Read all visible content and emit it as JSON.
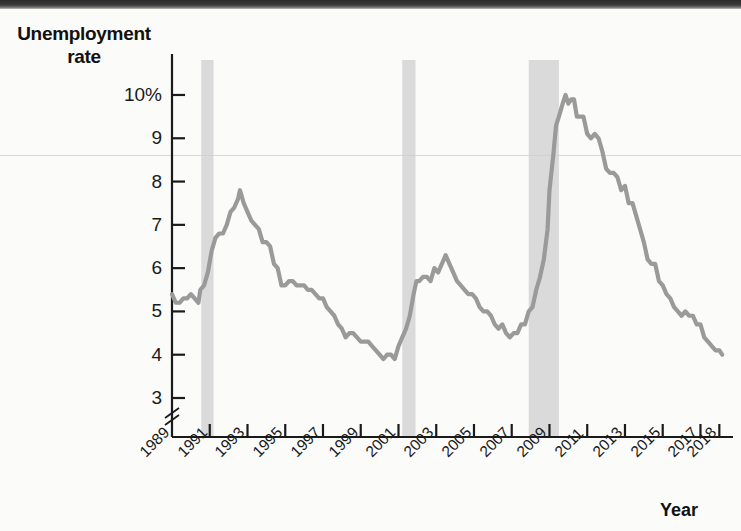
{
  "chart_data": {
    "type": "line",
    "title": "",
    "ylabel": "Unemployment rate",
    "xlabel": "Year",
    "y_unit": "%",
    "ylim": [
      3,
      10.6
    ],
    "xlim": [
      1989,
      2018.3
    ],
    "grid": false,
    "legend": "none",
    "axis_break_y": true,
    "y_ticks": [
      {
        "value": 10,
        "label": "10%"
      },
      {
        "value": 9,
        "label": "9"
      },
      {
        "value": 8,
        "label": "8"
      },
      {
        "value": 7,
        "label": "7"
      },
      {
        "value": 6,
        "label": "6"
      },
      {
        "value": 5,
        "label": "5"
      },
      {
        "value": 4,
        "label": "4"
      },
      {
        "value": 3,
        "label": "3"
      }
    ],
    "x_ticks": [
      {
        "value": 1989,
        "label": "1989"
      },
      {
        "value": 1991,
        "label": "1991"
      },
      {
        "value": 1993,
        "label": "1993"
      },
      {
        "value": 1995,
        "label": "1995"
      },
      {
        "value": 1997,
        "label": "1997"
      },
      {
        "value": 1999,
        "label": "1999"
      },
      {
        "value": 2001,
        "label": "2001"
      },
      {
        "value": 2003,
        "label": "2003"
      },
      {
        "value": 2005,
        "label": "2005"
      },
      {
        "value": 2007,
        "label": "2007"
      },
      {
        "value": 2009,
        "label": "2009"
      },
      {
        "value": 2011,
        "label": "2011"
      },
      {
        "value": 2013,
        "label": "2013"
      },
      {
        "value": 2015,
        "label": "2015"
      },
      {
        "value": 2017,
        "label": "2017"
      },
      {
        "value": 2018,
        "label": "2018"
      }
    ],
    "recession_bands": [
      {
        "name": "recession-1990-1991",
        "start": 1990.55,
        "end": 1991.2
      },
      {
        "name": "recession-2001",
        "start": 2001.2,
        "end": 2001.9
      },
      {
        "name": "recession-2007-2009",
        "start": 2007.9,
        "end": 2009.5
      }
    ],
    "series": [
      {
        "name": "Unemployment rate",
        "color": "#9a9a9a",
        "points": [
          [
            1989.0,
            5.4
          ],
          [
            1989.2,
            5.2
          ],
          [
            1989.4,
            5.2
          ],
          [
            1989.6,
            5.3
          ],
          [
            1989.8,
            5.3
          ],
          [
            1990.0,
            5.4
          ],
          [
            1990.2,
            5.3
          ],
          [
            1990.4,
            5.2
          ],
          [
            1990.5,
            5.5
          ],
          [
            1990.7,
            5.6
          ],
          [
            1990.9,
            5.9
          ],
          [
            1991.1,
            6.4
          ],
          [
            1991.3,
            6.7
          ],
          [
            1991.5,
            6.8
          ],
          [
            1991.7,
            6.8
          ],
          [
            1991.9,
            7.0
          ],
          [
            1992.1,
            7.3
          ],
          [
            1992.3,
            7.4
          ],
          [
            1992.5,
            7.6
          ],
          [
            1992.6,
            7.8
          ],
          [
            1992.8,
            7.5
          ],
          [
            1993.0,
            7.3
          ],
          [
            1993.2,
            7.1
          ],
          [
            1993.4,
            7.0
          ],
          [
            1993.6,
            6.9
          ],
          [
            1993.8,
            6.6
          ],
          [
            1994.0,
            6.6
          ],
          [
            1994.2,
            6.5
          ],
          [
            1994.4,
            6.1
          ],
          [
            1994.6,
            6.0
          ],
          [
            1994.8,
            5.6
          ],
          [
            1995.0,
            5.6
          ],
          [
            1995.2,
            5.7
          ],
          [
            1995.4,
            5.7
          ],
          [
            1995.6,
            5.6
          ],
          [
            1995.8,
            5.6
          ],
          [
            1996.0,
            5.6
          ],
          [
            1996.2,
            5.5
          ],
          [
            1996.4,
            5.5
          ],
          [
            1996.6,
            5.4
          ],
          [
            1996.8,
            5.3
          ],
          [
            1997.0,
            5.3
          ],
          [
            1997.2,
            5.1
          ],
          [
            1997.4,
            5.0
          ],
          [
            1997.6,
            4.9
          ],
          [
            1997.8,
            4.7
          ],
          [
            1998.0,
            4.6
          ],
          [
            1998.2,
            4.4
          ],
          [
            1998.4,
            4.5
          ],
          [
            1998.6,
            4.5
          ],
          [
            1998.8,
            4.4
          ],
          [
            1999.0,
            4.3
          ],
          [
            1999.2,
            4.3
          ],
          [
            1999.4,
            4.3
          ],
          [
            1999.6,
            4.2
          ],
          [
            1999.8,
            4.1
          ],
          [
            2000.0,
            4.0
          ],
          [
            2000.2,
            3.9
          ],
          [
            2000.4,
            4.0
          ],
          [
            2000.6,
            4.0
          ],
          [
            2000.8,
            3.9
          ],
          [
            2001.0,
            4.2
          ],
          [
            2001.2,
            4.4
          ],
          [
            2001.4,
            4.6
          ],
          [
            2001.6,
            4.9
          ],
          [
            2001.8,
            5.4
          ],
          [
            2001.95,
            5.7
          ],
          [
            2002.1,
            5.7
          ],
          [
            2002.3,
            5.8
          ],
          [
            2002.5,
            5.8
          ],
          [
            2002.7,
            5.7
          ],
          [
            2002.9,
            6.0
          ],
          [
            2003.1,
            5.9
          ],
          [
            2003.3,
            6.1
          ],
          [
            2003.5,
            6.3
          ],
          [
            2003.7,
            6.1
          ],
          [
            2003.9,
            5.9
          ],
          [
            2004.1,
            5.7
          ],
          [
            2004.3,
            5.6
          ],
          [
            2004.5,
            5.5
          ],
          [
            2004.7,
            5.4
          ],
          [
            2004.9,
            5.4
          ],
          [
            2005.1,
            5.3
          ],
          [
            2005.3,
            5.1
          ],
          [
            2005.5,
            5.0
          ],
          [
            2005.7,
            5.0
          ],
          [
            2005.9,
            4.9
          ],
          [
            2006.1,
            4.7
          ],
          [
            2006.3,
            4.6
          ],
          [
            2006.5,
            4.7
          ],
          [
            2006.7,
            4.5
          ],
          [
            2006.9,
            4.4
          ],
          [
            2007.1,
            4.5
          ],
          [
            2007.3,
            4.5
          ],
          [
            2007.5,
            4.7
          ],
          [
            2007.7,
            4.7
          ],
          [
            2007.9,
            5.0
          ],
          [
            2008.1,
            5.1
          ],
          [
            2008.3,
            5.5
          ],
          [
            2008.5,
            5.8
          ],
          [
            2008.7,
            6.2
          ],
          [
            2008.9,
            6.9
          ],
          [
            2009.0,
            7.8
          ],
          [
            2009.2,
            8.6
          ],
          [
            2009.35,
            9.3
          ],
          [
            2009.5,
            9.5
          ],
          [
            2009.7,
            9.8
          ],
          [
            2009.85,
            10.0
          ],
          [
            2010.0,
            9.8
          ],
          [
            2010.15,
            9.9
          ],
          [
            2010.3,
            9.9
          ],
          [
            2010.45,
            9.5
          ],
          [
            2010.6,
            9.5
          ],
          [
            2010.8,
            9.5
          ],
          [
            2011.0,
            9.1
          ],
          [
            2011.2,
            9.0
          ],
          [
            2011.4,
            9.1
          ],
          [
            2011.6,
            9.0
          ],
          [
            2011.8,
            8.7
          ],
          [
            2012.0,
            8.3
          ],
          [
            2012.2,
            8.2
          ],
          [
            2012.4,
            8.2
          ],
          [
            2012.6,
            8.1
          ],
          [
            2012.8,
            7.8
          ],
          [
            2013.0,
            7.9
          ],
          [
            2013.2,
            7.5
          ],
          [
            2013.4,
            7.5
          ],
          [
            2013.6,
            7.2
          ],
          [
            2013.8,
            6.9
          ],
          [
            2014.0,
            6.6
          ],
          [
            2014.2,
            6.2
          ],
          [
            2014.4,
            6.1
          ],
          [
            2014.6,
            6.1
          ],
          [
            2014.8,
            5.7
          ],
          [
            2015.0,
            5.6
          ],
          [
            2015.2,
            5.4
          ],
          [
            2015.4,
            5.3
          ],
          [
            2015.6,
            5.1
          ],
          [
            2015.8,
            5.0
          ],
          [
            2016.0,
            4.9
          ],
          [
            2016.2,
            5.0
          ],
          [
            2016.4,
            4.9
          ],
          [
            2016.6,
            4.9
          ],
          [
            2016.8,
            4.7
          ],
          [
            2017.0,
            4.7
          ],
          [
            2017.2,
            4.4
          ],
          [
            2017.4,
            4.3
          ],
          [
            2017.6,
            4.2
          ],
          [
            2017.8,
            4.1
          ],
          [
            2018.0,
            4.1
          ],
          [
            2018.15,
            4.0
          ]
        ]
      }
    ]
  },
  "labels": {
    "y_axis_title_line1": "Unemployment",
    "y_axis_title_line2": "rate",
    "x_axis_title": "Year"
  }
}
